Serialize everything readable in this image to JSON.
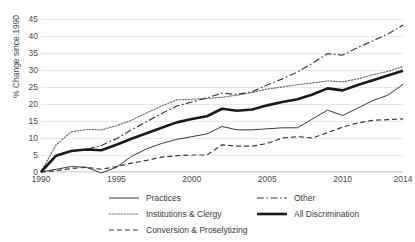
{
  "chart_data": {
    "type": "line",
    "title": "",
    "xlabel": "",
    "ylabel": "% Change since 1990",
    "xlim": [
      1990,
      2014
    ],
    "ylim": [
      0,
      45
    ],
    "grid": true,
    "legend_position": "bottom",
    "ytick_labels": [
      "45",
      "40",
      "35",
      "30",
      "25",
      "20",
      "15",
      "10",
      "5",
      "0"
    ],
    "ytick_values": [
      45,
      40,
      35,
      30,
      25,
      20,
      15,
      10,
      5,
      0
    ],
    "xtick_labels": [
      "1990",
      "1995",
      "2000",
      "2005",
      "2010",
      "2014"
    ],
    "xtick_values": [
      1990,
      1995,
      2000,
      2005,
      2010,
      2014
    ],
    "x": [
      1990,
      1991,
      1992,
      1993,
      1994,
      1995,
      1996,
      1997,
      1998,
      1999,
      2000,
      2001,
      2002,
      2003,
      2004,
      2005,
      2006,
      2007,
      2008,
      2009,
      2010,
      2011,
      2012,
      2013,
      2014
    ],
    "series": [
      {
        "name": "Practices",
        "style": "solid-thin",
        "color": "#3a3a3a",
        "values": [
          0,
          0.8,
          1.6,
          1.4,
          -0.3,
          1.4,
          4.6,
          6.8,
          8.4,
          9.6,
          10.4,
          11.2,
          13.4,
          12.4,
          12.4,
          12.7,
          13.0,
          13.0,
          15.6,
          18.2,
          16.6,
          18.8,
          21.0,
          22.6,
          25.8
        ]
      },
      {
        "name": "Institutions & Clergy",
        "style": "dotted",
        "color": "#6e6e6e",
        "values": [
          0,
          8.0,
          11.8,
          12.5,
          12.4,
          13.6,
          15.2,
          17.4,
          19.4,
          21.2,
          21.4,
          21.6,
          22.0,
          22.6,
          23.4,
          24.4,
          25.0,
          25.7,
          26.2,
          26.8,
          26.5,
          27.4,
          28.6,
          29.6,
          31.0
        ]
      },
      {
        "name": "Conversion & Proselytizing",
        "style": "dashed",
        "color": "#3a3a3a",
        "values": [
          0,
          0.4,
          1.0,
          1.4,
          0.8,
          1.6,
          2.6,
          3.4,
          4.4,
          4.8,
          5.0,
          5.0,
          8.0,
          7.6,
          7.6,
          8.4,
          10.0,
          10.4,
          10.0,
          11.6,
          13.2,
          14.4,
          15.2,
          15.4,
          15.6
        ]
      },
      {
        "name": "Other",
        "style": "dash-dot",
        "color": "#3a3a3a",
        "values": [
          0,
          4.6,
          6.2,
          6.6,
          7.8,
          9.8,
          12.4,
          14.8,
          17.2,
          19.4,
          20.6,
          21.8,
          23.2,
          22.8,
          23.6,
          25.6,
          27.4,
          29.4,
          32.0,
          34.8,
          34.4,
          36.6,
          38.6,
          40.6,
          43.2
        ]
      },
      {
        "name": "All Discrimination",
        "style": "solid-thick",
        "color": "#1a1a1a",
        "values": [
          0,
          4.8,
          6.2,
          6.6,
          6.4,
          8.0,
          9.8,
          11.4,
          13.0,
          14.6,
          15.6,
          16.4,
          18.6,
          18.0,
          18.4,
          19.6,
          20.6,
          21.4,
          22.8,
          24.6,
          24.0,
          25.6,
          27.0,
          28.4,
          29.8
        ]
      }
    ]
  },
  "legend": {
    "items": [
      {
        "label": "Practices",
        "style": "solid-thin",
        "column": 1,
        "row": 0
      },
      {
        "label": "Institutions & Clergy",
        "style": "dotted",
        "column": 1,
        "row": 1
      },
      {
        "label": "Conversion & Proselytizing",
        "style": "dashed",
        "column": 1,
        "row": 2
      },
      {
        "label": "Other",
        "style": "dash-dot",
        "column": 2,
        "row": 0
      },
      {
        "label": "All Discrimination",
        "style": "solid-thick",
        "column": 2,
        "row": 1
      }
    ]
  }
}
